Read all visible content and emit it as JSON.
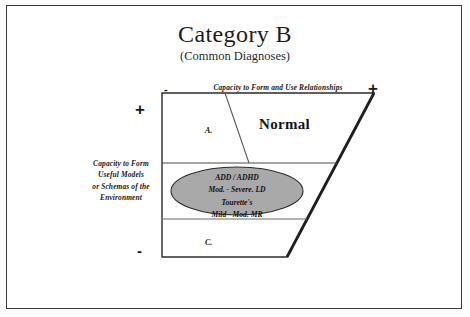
{
  "title": "Category B",
  "subtitle": "(Common Diagnoses)",
  "axes": {
    "horizontal": {
      "label": "Capacity to Form and Use Relationships",
      "negative_sign": "-",
      "positive_sign": "+"
    },
    "vertical": {
      "label_lines": [
        "Capacity to Form",
        "Useful Models",
        "or Schemas of the",
        "Environment"
      ],
      "positive_sign": "+",
      "negative_sign": "-"
    }
  },
  "regions": {
    "top_label": "A.",
    "bottom_label": "C.",
    "normal_label": "Normal"
  },
  "diagnoses_ellipse": {
    "fill_color": "#a9a9a9",
    "stroke_color": "#2b2b2b",
    "lines": [
      "ADD / ADHD",
      "Mod. - Severe.  LD",
      "Tourette's",
      "Mild - Mod. MR"
    ]
  },
  "colors": {
    "page_background": "#ffffff",
    "frame_border": "#3a3a3a",
    "line_color": "#2b2b2b",
    "thick_diagonal": "#1e1e1e",
    "text_color": "#161616"
  }
}
